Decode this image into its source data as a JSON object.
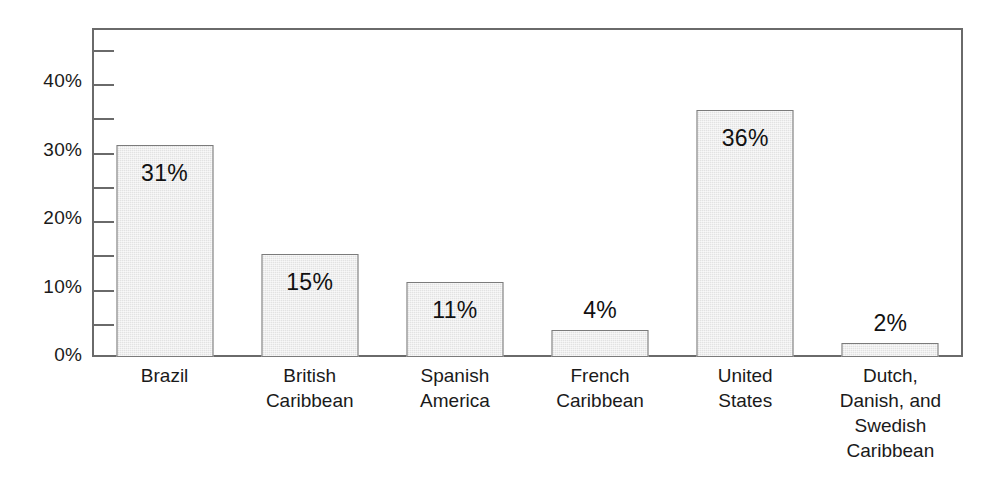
{
  "chart_data": {
    "type": "bar",
    "title": "",
    "subtitle": "",
    "xlabel": "",
    "ylabel": "",
    "categories": [
      "Brazil",
      "British Caribbean",
      "Spanish America",
      "French Caribbean",
      "United States",
      "Dutch, Danish, and Swedish Caribbean"
    ],
    "category_lines": [
      [
        "Brazil"
      ],
      [
        "British",
        "Caribbean"
      ],
      [
        "Spanish",
        "America"
      ],
      [
        "French",
        "Caribbean"
      ],
      [
        "United",
        "States"
      ],
      [
        "Dutch,",
        "Danish, and",
        "Swedish",
        "Caribbean"
      ]
    ],
    "values": [
      31,
      15,
      11,
      4,
      36,
      2
    ],
    "value_labels": [
      "31%",
      "15%",
      "11%",
      "4%",
      "36%",
      "2%"
    ],
    "label_placement": [
      "inside",
      "inside",
      "inside",
      "outside",
      "inside",
      "outside"
    ],
    "ylim": [
      0,
      48
    ],
    "ytick_values": [
      0,
      5,
      10,
      15,
      20,
      25,
      30,
      35,
      40,
      45
    ],
    "ytick_labels": [
      "0%",
      "",
      "10%",
      "",
      "20%",
      "",
      "30%",
      "",
      "40%",
      ""
    ],
    "ytick_labeled_values": [
      0,
      10,
      20,
      30,
      40
    ],
    "ytick_labeled_text": [
      "0%",
      "10%",
      "20%",
      "30%",
      "40%"
    ],
    "grid": false,
    "legend": null,
    "legend_position": "none",
    "bar_fill_color": "#e2e2e2",
    "bar_border_color": "#7b7b7b",
    "axis_color": "#6a6a6a",
    "text_color": "#1a1a1a",
    "background_color": "#ffffff"
  }
}
